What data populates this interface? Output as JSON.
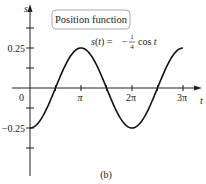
{
  "chart_data": {
    "type": "line",
    "title": "Position function",
    "equation": "s(t) = -1/4 cos t",
    "equation_parts": {
      "lhs": "s(t) =",
      "minus": "−",
      "num": "1",
      "den": "4",
      "rhs": "cos t"
    },
    "xlabel": "t",
    "ylabel": "s",
    "caption": "(b)",
    "x_ticks": [
      "π",
      "2π",
      "3π"
    ],
    "y_ticks": [
      "0.25",
      "0",
      "−0.25"
    ],
    "xlim": [
      0,
      9.8
    ],
    "ylim": [
      -0.375,
      0.375
    ],
    "series": [
      {
        "name": "s(t)",
        "function": "-0.25*cos(t)",
        "t_range": [
          0,
          9.42
        ]
      }
    ],
    "sample_points": {
      "x": [
        0,
        1.5708,
        3.1416,
        4.7124,
        6.2832,
        7.854,
        9.4248
      ],
      "y": [
        -0.25,
        0,
        0.25,
        0,
        -0.25,
        0,
        0.25
      ]
    },
    "grid": false,
    "legend": "none"
  }
}
